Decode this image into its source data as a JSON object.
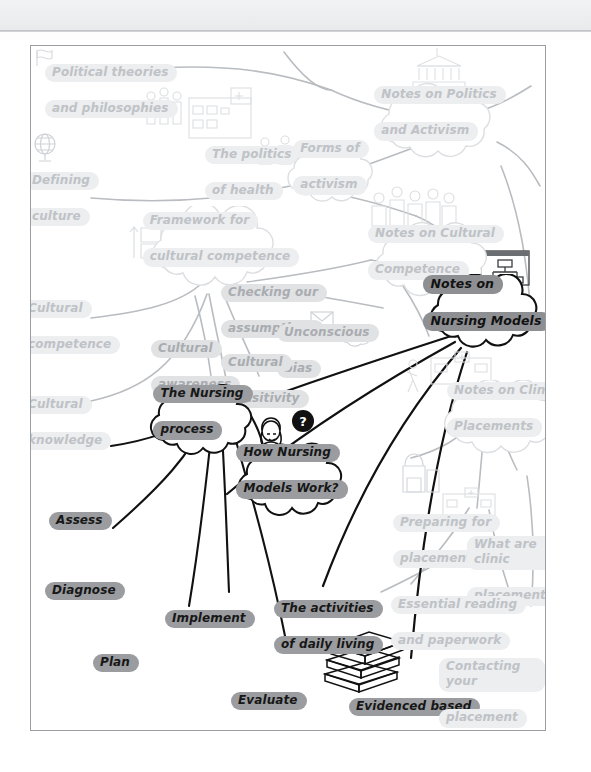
{
  "app": {
    "header_bar": "",
    "canvas_title": "Nursing mind map canvas"
  },
  "mindmap": {
    "focus_node": "Notes on Nursing Models",
    "nodes": [
      {
        "id": "political-theories",
        "label": "Political theories\nand philosophies",
        "shape": "label",
        "level": "ghost"
      },
      {
        "id": "defining-culture",
        "label": "Defining\nculture",
        "shape": "label",
        "level": "ghost"
      },
      {
        "id": "the-politics-of-health",
        "label": "The politics\nof health",
        "shape": "label",
        "level": "ghost"
      },
      {
        "id": "forms-of-activism",
        "label": "Forms of\nactivism",
        "shape": "cloud",
        "level": "ghost"
      },
      {
        "id": "notes-on-politics",
        "label": "Notes on Politics\nand Activism",
        "shape": "cloud",
        "level": "ghost"
      },
      {
        "id": "framework-cultural-competence",
        "label": "Framework for\ncultural competence",
        "shape": "cloud",
        "level": "ghost"
      },
      {
        "id": "notes-on-cultural-competence",
        "label": "Notes on Cultural\nCompetence",
        "shape": "cloud",
        "level": "ghost"
      },
      {
        "id": "cultural-competence",
        "label": "Cultural\ncompetence",
        "shape": "label",
        "level": "ghost"
      },
      {
        "id": "checking-our-assumptions",
        "label": "Checking our\nassumptions",
        "shape": "label",
        "level": "far"
      },
      {
        "id": "unconscious-bias",
        "label": "Unconscious\nbias",
        "shape": "label",
        "level": "far"
      },
      {
        "id": "cultural-awareness",
        "label": "Cultural\nawareness",
        "shape": "label",
        "level": "far"
      },
      {
        "id": "cultural-sensitivity",
        "label": "Cultural\nsensitivity",
        "shape": "label",
        "level": "far"
      },
      {
        "id": "cultural-knowledge",
        "label": "Cultural\nknowledge",
        "shape": "label",
        "level": "ghost"
      },
      {
        "id": "notes-on-nursing-models",
        "label": "Notes on\nNursing Models",
        "shape": "cloud",
        "level": "focus"
      },
      {
        "id": "the-nursing-process",
        "label": "The Nursing\nprocess",
        "shape": "cloud",
        "level": "near"
      },
      {
        "id": "how-nursing-models-work",
        "label": "How Nursing\nModels Work?",
        "shape": "cloud",
        "level": "near"
      },
      {
        "id": "assess",
        "label": "Assess",
        "shape": "label",
        "level": "near"
      },
      {
        "id": "diagnose",
        "label": "Diagnose",
        "shape": "label",
        "level": "near"
      },
      {
        "id": "implement",
        "label": "Implement",
        "shape": "label",
        "level": "near"
      },
      {
        "id": "plan",
        "label": "Plan",
        "shape": "label",
        "level": "near"
      },
      {
        "id": "evaluate",
        "label": "Evaluate",
        "shape": "label",
        "level": "near"
      },
      {
        "id": "activities-of-daily-living",
        "label": "The activities\nof daily living",
        "shape": "label",
        "level": "near"
      },
      {
        "id": "evidenced-based-nursing",
        "label": "Evidenced based\nnursing and models",
        "shape": "label",
        "level": "near"
      },
      {
        "id": "notes-on-clinical-placements",
        "label": "Notes on Clinic\nPlacements",
        "shape": "cloud",
        "level": "ghost"
      },
      {
        "id": "preparing-for-placements",
        "label": "Preparing for\nplacements",
        "shape": "label",
        "level": "ghost"
      },
      {
        "id": "what-are-clinical-placements",
        "label": "What are clinic\nplacements?",
        "shape": "label",
        "level": "ghost"
      },
      {
        "id": "essential-reading",
        "label": "Essential reading\nand paperwork",
        "shape": "label",
        "level": "ghost"
      },
      {
        "id": "contacting-your-placement",
        "label": "Contacting your\nplacement",
        "shape": "label",
        "level": "ghost"
      }
    ],
    "icons": [
      {
        "id": "flag-icon",
        "name": "flag-icon"
      },
      {
        "id": "globe-icon",
        "name": "globe-icon"
      },
      {
        "id": "hospital-icon",
        "name": "hospital-people-icon"
      },
      {
        "id": "protest-icon",
        "name": "protest-people-icon"
      },
      {
        "id": "parliament-icon",
        "name": "parliament-building-icon"
      },
      {
        "id": "crowd-icon",
        "name": "crowd-people-icon"
      },
      {
        "id": "boxes-icon",
        "name": "boxes-exchange-icon"
      },
      {
        "id": "envelope-icon",
        "name": "envelope-icon"
      },
      {
        "id": "brain-icon",
        "name": "brain-icon"
      },
      {
        "id": "cycle-icon",
        "name": "refresh-cycle-icon"
      },
      {
        "id": "nurse-question-icon",
        "name": "nurse-question-icon"
      },
      {
        "id": "whiteboard-icon",
        "name": "whiteboard-diagram-icon"
      },
      {
        "id": "walking-clinic-icon",
        "name": "walking-to-clinic-icon"
      },
      {
        "id": "backpack-icon",
        "name": "backpack-icon"
      },
      {
        "id": "clinic-icon",
        "name": "clinic-building-icon"
      },
      {
        "id": "books-icon",
        "name": "stack-of-books-icon"
      }
    ],
    "colors": {
      "focus_highlight": "#8d8f93",
      "near_highlight": "#9a9c9f",
      "mid_highlight": "#c9cbcd",
      "far_highlight": "#e0e2e4",
      "ghost_highlight": "#eceef0",
      "edge_active": "#111111",
      "edge_dim": "#b9bcc0",
      "frame_border": "#9a9da1",
      "canvas_bg": "#ffffff"
    }
  }
}
